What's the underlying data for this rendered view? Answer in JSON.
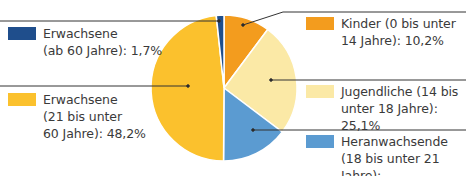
{
  "chart_data": {
    "type": "pie",
    "title": "",
    "start_angle": "top",
    "direction": "clockwise",
    "categories": [
      "Kinder (0 bis unter 14 Jahre)",
      "Jugendliche (14 bis unter 18 Jahre)",
      "Heranwachsende (18 bis unter 21 Jahre)",
      "Erwachsene (21 bis unter 60 Jahre)",
      "Erwachsene (ab 60 Jahre)"
    ],
    "values": [
      10.2,
      25.1,
      14.8,
      48.2,
      1.7
    ],
    "unit": "%",
    "colors": [
      "#f39c1e",
      "#fbe9a6",
      "#5b9bd1",
      "#fbc12d",
      "#1f4e8c"
    ],
    "legend_position": "split left/right with leader lines"
  },
  "legend": {
    "erwachsene60": {
      "label": "Erwachsene\n(ab 60 Jahre): 1,7%",
      "color": "#1f4e8c"
    },
    "erwachsene21": {
      "label": "Erwachsene\n(21 bis unter\n60 Jahre): 48,2%",
      "color": "#fbc12d"
    },
    "kinder": {
      "label": "Kinder (0 bis unter\n14 Jahre): 10,2%",
      "color": "#f39c1e"
    },
    "jugendliche": {
      "label": "Jugendliche (14 bis\nunter 18 Jahre): 25,1%",
      "color": "#fbe9a6"
    },
    "heranwachsende": {
      "label": "Heranwachsende\n(18 bis unter 21 Jahre):\n14,8%",
      "color": "#5b9bd1"
    }
  }
}
